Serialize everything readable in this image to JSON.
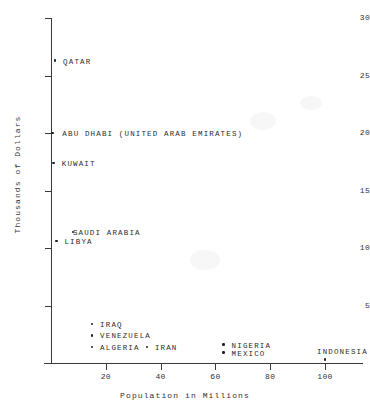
{
  "chart_data": {
    "type": "scatter",
    "title": "",
    "xlabel": "Population in Millions",
    "ylabel": "Thousands of Dollars",
    "xlim": [
      0,
      105
    ],
    "ylim": [
      0,
      30
    ],
    "xticks": [
      20,
      40,
      60,
      80,
      100
    ],
    "yticks": [
      5,
      10,
      15,
      20,
      25,
      30
    ],
    "grid": false,
    "legend": "none",
    "points": [
      {
        "label": "QATAR",
        "x": 1.5,
        "y": 26.3,
        "label_dx": 8,
        "label_dy": -3
      },
      {
        "label": "ABU DHABI (UNITED ARAB EMIRATES)",
        "x": 0.5,
        "y": 20.0,
        "label_dx": 10,
        "label_dy": -3
      },
      {
        "label": "KUWAIT",
        "x": 1.0,
        "y": 17.4,
        "label_dx": 8,
        "label_dy": -3
      },
      {
        "label": "SAUDI ARABIA",
        "x": 8.0,
        "y": 11.4,
        "label_dx": 0,
        "label_dy": -3
      },
      {
        "label": "LIBYA",
        "x": 2.0,
        "y": 10.6,
        "label_dx": 8,
        "label_dy": -3
      },
      {
        "label": "IRAQ",
        "x": 15.0,
        "y": 3.4,
        "label_dx": 8,
        "label_dy": -3
      },
      {
        "label": "VENEZUELA",
        "x": 15.0,
        "y": 2.4,
        "label_dx": 8,
        "label_dy": -3
      },
      {
        "label": "ALGERIA",
        "x": 15.0,
        "y": 1.4,
        "label_dx": 8,
        "label_dy": -3
      },
      {
        "label": "IRAN",
        "x": 35.0,
        "y": 1.4,
        "label_dx": 8,
        "label_dy": -3
      },
      {
        "label": "NIGERIA",
        "x": 63.0,
        "y": 1.6,
        "label_dx": 8,
        "label_dy": -3
      },
      {
        "label": "MEXICO",
        "x": 63.0,
        "y": 0.9,
        "label_dx": 8,
        "label_dy": -3
      },
      {
        "label": "INDONESIA",
        "x": 100.0,
        "y": 0.3,
        "label_dx": -8,
        "label_dy": -12
      }
    ]
  },
  "style": {
    "ink_color": "#2a2a2a",
    "axis_color": "#3a3a3a",
    "point_color": "#1f1f1f",
    "background": "#ffffff"
  }
}
